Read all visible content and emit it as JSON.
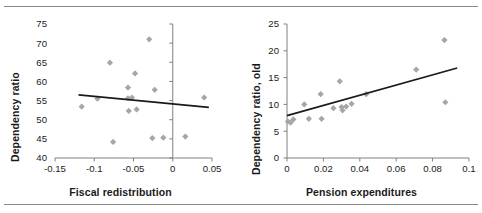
{
  "figure": {
    "background": "#ffffff",
    "rule_color": "#8a8a8a",
    "marker_color": "#a6a6a6",
    "trend_color": "#1a1a1a",
    "axis_color": "#808080"
  },
  "panels": [
    {
      "id": "left",
      "xlabel": "Fiscal redistribution",
      "ylabel": "Dependency ratio"
    },
    {
      "id": "right",
      "xlabel": "Pension expenditures",
      "ylabel": "Dependency ratio, old"
    }
  ],
  "chart_data": [
    {
      "type": "scatter",
      "title": "",
      "xlabel": "Fiscal redistribution",
      "ylabel": "Dependency ratio",
      "xlim": [
        -0.15,
        0.05
      ],
      "ylim": [
        40,
        75
      ],
      "xticks": [
        -0.15,
        -0.1,
        -0.05,
        0,
        0.05
      ],
      "xticklabels": [
        "-0.15",
        "-0.1",
        "-0.05",
        "0",
        "0.05"
      ],
      "yticks": [
        40,
        45,
        50,
        55,
        60,
        65,
        70,
        75
      ],
      "yticklabels": [
        "40",
        "45",
        "50",
        "55",
        "60",
        "65",
        "70",
        "75"
      ],
      "grid": false,
      "legend": "none",
      "vertical_axis_at_x": 0,
      "points": [
        {
          "x": -0.116,
          "y": 53.4
        },
        {
          "x": -0.096,
          "y": 55.5
        },
        {
          "x": -0.08,
          "y": 64.9
        },
        {
          "x": -0.076,
          "y": 44.2
        },
        {
          "x": -0.057,
          "y": 58.4
        },
        {
          "x": -0.057,
          "y": 55.6
        },
        {
          "x": -0.056,
          "y": 52.3
        },
        {
          "x": -0.052,
          "y": 55.8
        },
        {
          "x": -0.048,
          "y": 62.1
        },
        {
          "x": -0.046,
          "y": 52.7
        },
        {
          "x": -0.03,
          "y": 71.0
        },
        {
          "x": -0.023,
          "y": 57.8
        },
        {
          "x": -0.026,
          "y": 45.2
        },
        {
          "x": -0.012,
          "y": 45.3
        },
        {
          "x": 0.016,
          "y": 45.6
        },
        {
          "x": 0.04,
          "y": 55.8
        }
      ],
      "trendline": {
        "x0": -0.12,
        "y0": 56.5,
        "x1": 0.046,
        "y1": 53.2
      }
    },
    {
      "type": "scatter",
      "title": "",
      "xlabel": "Pension expenditures",
      "ylabel": "Dependency ratio, old",
      "xlim": [
        0,
        0.1
      ],
      "ylim": [
        0,
        25
      ],
      "xticks": [
        0,
        0.02,
        0.04,
        0.06,
        0.08,
        0.1
      ],
      "xticklabels": [
        "0",
        "0.02",
        "0.04",
        "0.06",
        "0.08",
        "0.1"
      ],
      "yticks": [
        0,
        5,
        10,
        15,
        20,
        25
      ],
      "yticklabels": [
        "0",
        "5",
        "10",
        "15",
        "20",
        "25"
      ],
      "grid": false,
      "legend": "none",
      "points": [
        {
          "x": 0.0005,
          "y": 6.8
        },
        {
          "x": 0.002,
          "y": 6.6
        },
        {
          "x": 0.0035,
          "y": 7.2
        },
        {
          "x": 0.0095,
          "y": 10.0
        },
        {
          "x": 0.012,
          "y": 7.3
        },
        {
          "x": 0.0185,
          "y": 11.9
        },
        {
          "x": 0.019,
          "y": 7.3
        },
        {
          "x": 0.0255,
          "y": 9.3
        },
        {
          "x": 0.029,
          "y": 14.3
        },
        {
          "x": 0.03,
          "y": 9.5
        },
        {
          "x": 0.0305,
          "y": 8.9
        },
        {
          "x": 0.0325,
          "y": 9.6
        },
        {
          "x": 0.0355,
          "y": 10.1
        },
        {
          "x": 0.0435,
          "y": 11.9
        },
        {
          "x": 0.071,
          "y": 16.5
        },
        {
          "x": 0.0865,
          "y": 22.0
        },
        {
          "x": 0.087,
          "y": 10.4
        }
      ],
      "trendline": {
        "x0": 0.0,
        "y0": 7.9,
        "x1": 0.0935,
        "y1": 16.8
      }
    }
  ]
}
